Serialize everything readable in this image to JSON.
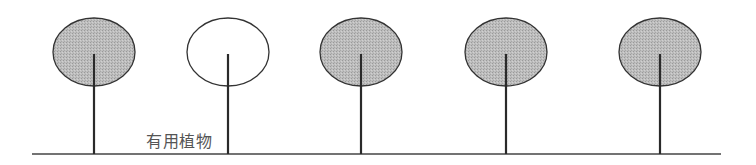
{
  "diagram": {
    "label": "有用植物",
    "colors": {
      "filled_crown": "#bdbdbd",
      "outline": "#333333",
      "trunk": "#2a2a2a",
      "ground": "#444444",
      "hollow_crown": "#ffffff"
    },
    "ground": {
      "y": 154,
      "x1": 32,
      "x2": 721
    },
    "trees": [
      {
        "cx": 94,
        "filled": true
      },
      {
        "cx": 228,
        "filled": false
      },
      {
        "cx": 361,
        "filled": true
      },
      {
        "cx": 506,
        "filled": true
      },
      {
        "cx": 660,
        "filled": true
      }
    ]
  }
}
